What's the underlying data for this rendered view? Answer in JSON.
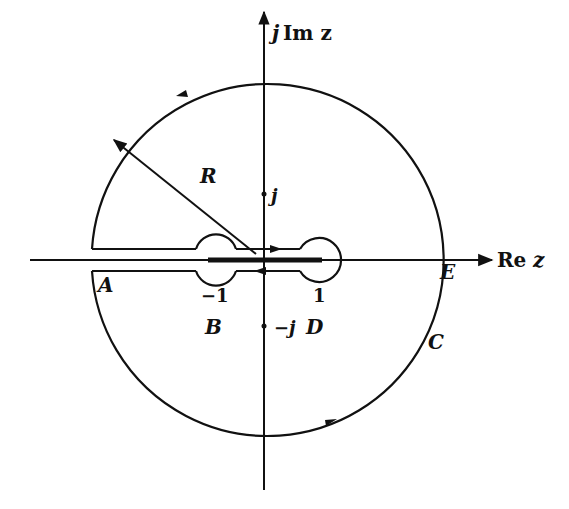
{
  "diagram": {
    "type": "complex-plane contour (keyhole/dumbbell contour around branch cut)",
    "axes": {
      "imag_label_j": "j",
      "imag_label_rest": "Im z",
      "real_label_re": "Re",
      "real_label_z": "z"
    },
    "labels": {
      "radius": "R",
      "j_point": "j",
      "minus_j_point": "−j",
      "minus_one": "−1",
      "one": "1",
      "A": "A",
      "B": "B",
      "C": "C",
      "D": "D",
      "E": "E"
    },
    "colors": {
      "stroke": "#111111",
      "background": "#ffffff"
    }
  }
}
